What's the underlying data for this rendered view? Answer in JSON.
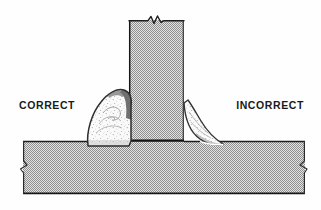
{
  "figure": {
    "type": "technical-illustration",
    "background_color": "#fefefe",
    "width": 321,
    "height": 210
  },
  "labels": {
    "correct": "CORRECT",
    "incorrect": "INCORRECT"
  },
  "colors": {
    "steel_fill": "#a8a8a8",
    "steel_dither_light": "#dcdcdc",
    "outline_dark": "#1a1a1a",
    "weld_fill": "#fbfbfb",
    "weld_shadow": "#6f6f6f",
    "weld_outline": "#3a3a3a",
    "speckle": "#8c8c8c",
    "label_color": "#1a1a1a"
  },
  "parts": {
    "vertical_plate": {
      "name": "vertical-plate",
      "left": 129,
      "right": 184,
      "top": 20,
      "bottom": 141,
      "break_symbol_top": true
    },
    "horizontal_plate": {
      "name": "horizontal-plate",
      "left": 23,
      "right": 305,
      "top": 141,
      "bottom": 194,
      "break_symbol_left": true,
      "break_symbol_right": true
    },
    "correct_weld": {
      "name": "correct-fillet-weld",
      "side": "left",
      "profile": "convex",
      "description": "large full convex fillet bead with equal legs"
    },
    "incorrect_weld": {
      "name": "incorrect-fillet-weld",
      "side": "right",
      "profile": "concave-undersized",
      "description": "thin undercut crescent bead with insufficient throat"
    }
  }
}
